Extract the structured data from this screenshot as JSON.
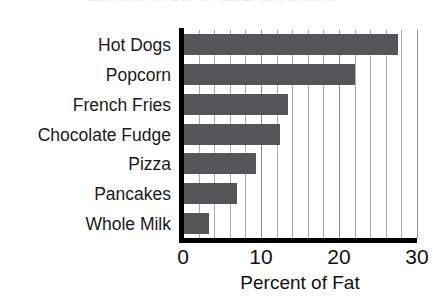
{
  "chart_data": {
    "type": "bar",
    "orientation": "horizontal",
    "title": "Percent of Fat in Selected Foods",
    "xlabel": "Percent of Fat",
    "ylabel": "",
    "categories": [
      "Hot Dogs",
      "Popcorn",
      "French Fries",
      "Chocolate Fudge",
      "Pizza",
      "Pancakes",
      "Whole Milk"
    ],
    "values": [
      27.5,
      22,
      13.4,
      12.4,
      9.3,
      6.9,
      3.3
    ],
    "xlim": [
      0,
      30
    ],
    "major_ticks": [
      0,
      10,
      20,
      30
    ],
    "minor_tick_step": 2,
    "grid": true,
    "legend": "none",
    "bar_color": "#555557",
    "gridline_color": "#aaaaac",
    "axis_color": "#000000"
  },
  "axis": {
    "tick_labels": [
      "0",
      "10",
      "20",
      "30"
    ]
  }
}
